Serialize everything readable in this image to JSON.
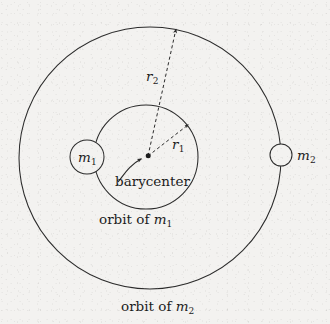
{
  "figure": {
    "kind": "two-body-orbit-diagram",
    "background_color": "#f3f2f0",
    "stroke_color": "#2b2b2b",
    "text_color": "#1c1c1c",
    "labels": {
      "mass1": "m",
      "mass1_sub": "1",
      "mass2": "m",
      "mass2_sub": "2",
      "radius1": "r",
      "radius1_sub": "1",
      "radius2": "r",
      "radius2_sub": "2",
      "barycenter": "barycenter",
      "orbit1_prefix": "orbit of ",
      "orbit1_mass": "m",
      "orbit1_sub": "1",
      "orbit2_prefix": "orbit of ",
      "orbit2_mass": "m",
      "orbit2_sub": "2"
    },
    "geometry": {
      "outer_orbit": {
        "cx": 150,
        "cy": 158,
        "r": 131
      },
      "inner_orbit": {
        "cx": 146,
        "cy": 157,
        "r": 52
      },
      "barycenter_point": {
        "x": 148,
        "y": 156
      },
      "mass1_body": {
        "cx": 87,
        "cy": 157,
        "r": 17
      },
      "mass2_body": {
        "cx": 281,
        "cy": 155,
        "r": 11
      },
      "r1_vector": {
        "x1": 148,
        "y1": 156,
        "x2": 189,
        "y2": 124
      },
      "r2_vector": {
        "x1": 148,
        "y1": 156,
        "x2": 176,
        "y2": 28
      }
    }
  }
}
